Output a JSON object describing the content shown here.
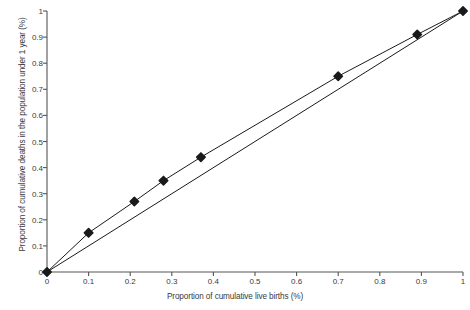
{
  "chart_data": {
    "type": "line",
    "title": "",
    "xlabel": "Proportion of cumulative live births (%)",
    "ylabel": "Proportion of cumulative deaths in the population under 1 year (%)",
    "xlim": [
      0,
      1
    ],
    "ylim": [
      0,
      1
    ],
    "xticks": [
      "0",
      "0.1",
      "0.2",
      "0.3",
      "0.4",
      "0.5",
      "0.6",
      "0.7",
      "0.8",
      "0.9",
      "1"
    ],
    "xtick_values": [
      0,
      0.1,
      0.2,
      0.3,
      0.4,
      0.5,
      0.6,
      0.7,
      0.8,
      0.9,
      1
    ],
    "yticks": [
      "0",
      "0.1",
      "0.2",
      "0.3",
      "0.4",
      "0.5",
      "0.6",
      "0.7",
      "0.8",
      "0.9",
      "1"
    ],
    "ytick_values": [
      0,
      0.1,
      0.2,
      0.3,
      0.4,
      0.5,
      0.6,
      0.7,
      0.8,
      0.9,
      1
    ],
    "grid": false,
    "legend": "none",
    "series": [
      {
        "name": "Lorenz curve",
        "marker": "diamond",
        "color": "#1a1a1a",
        "x": [
          0,
          0.1,
          0.21,
          0.28,
          0.37,
          0.7,
          0.89,
          1
        ],
        "y": [
          0,
          0.15,
          0.27,
          0.35,
          0.44,
          0.75,
          0.91,
          1
        ]
      },
      {
        "name": "Line of equality",
        "marker": "none",
        "color": "#1a1a1a",
        "x": [
          0,
          1
        ],
        "y": [
          0,
          1
        ]
      }
    ]
  },
  "axes": {
    "x_title": "Proportion of cumulative live births (%)",
    "y_title": "Proportion of cumulative deaths in the population under 1 year (%)"
  }
}
